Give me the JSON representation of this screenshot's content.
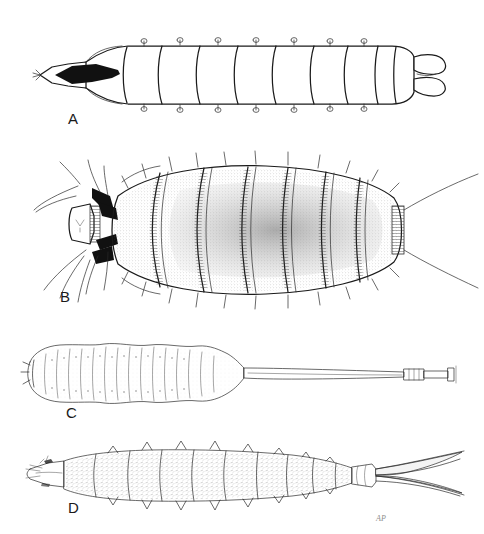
{
  "plate": {
    "title": "Fly larvae (Diptera) — comparative morphology plate",
    "background_color": "#ffffff",
    "ink_color": "#1b1b1b",
    "stipple_color": "#6e6e6e",
    "width": 484,
    "height": 534,
    "signature": "AP"
  },
  "panels": [
    {
      "id": "a",
      "label": "A",
      "label_x": 74,
      "label_y": 122,
      "caption": "Maggot-type larva, dorsal view; smooth segmented body, pointed head with dark mouth hooks, bilobed posterior spiracles",
      "segments": 11,
      "style": "outline",
      "features": [
        "pointed-head",
        "black-mouth-hooks",
        "dorsal-papillae",
        "bilobed-posterior"
      ]
    },
    {
      "id": "b",
      "label": "B",
      "label_x": 66,
      "label_y": 300,
      "caption": "Broad flattened larva with stippled shading, marginal bristle fringes and long anterior and caudal setae",
      "segments": 8,
      "style": "stippled",
      "features": [
        "head-capsule",
        "dark-sclerites",
        "long-setae",
        "bristle-fringe",
        "caudal-filaments"
      ]
    },
    {
      "id": "c",
      "label": "C",
      "label_x": 72,
      "label_y": 407,
      "caption": "Rat-tailed maggot; plump striated body with a very long telescoping respiratory siphon",
      "segments": 8,
      "style": "fine-line",
      "features": [
        "long-breathing-siphon",
        "siphon-tip-knob",
        "ventral-prolegs",
        "wavy-margin"
      ]
    },
    {
      "id": "d",
      "label": "D",
      "label_x": 74,
      "label_y": 500,
      "caption": "Elongate larva with lateral spine-like processes, narrow snout and forked caudal prongs",
      "segments": 10,
      "style": "textured",
      "features": [
        "tapered-snout",
        "lateral-spines",
        "forked-tail",
        "terminal-collar"
      ]
    }
  ]
}
